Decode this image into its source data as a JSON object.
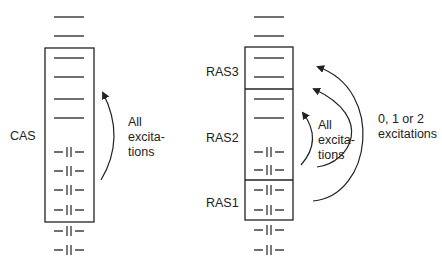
{
  "cas_panel": {
    "label": "CAS",
    "arrow_label": [
      "All",
      "excita-",
      "tions"
    ],
    "orbitals": [
      {
        "y": 17,
        "occupied": false
      },
      {
        "y": 36,
        "occupied": false
      },
      {
        "y": 58,
        "occupied": false
      },
      {
        "y": 77,
        "occupied": false
      },
      {
        "y": 99,
        "occupied": false
      },
      {
        "y": 118,
        "occupied": false
      },
      {
        "y": 152,
        "occupied": true
      },
      {
        "y": 171,
        "occupied": true
      },
      {
        "y": 190,
        "occupied": true
      },
      {
        "y": 210,
        "occupied": true
      },
      {
        "y": 231,
        "occupied": true
      },
      {
        "y": 250,
        "occupied": true
      }
    ]
  },
  "ras_panel": {
    "subspaces": [
      {
        "label": "RAS3"
      },
      {
        "label": "RAS2"
      },
      {
        "label": "RAS1"
      }
    ],
    "inner_arrow_label": [
      "All",
      "excita-",
      "tions"
    ],
    "outer_arrow_label": [
      "0, 1 or 2",
      "excitations"
    ],
    "orbitals": [
      {
        "y": 17,
        "occupied": false
      },
      {
        "y": 36,
        "occupied": false
      },
      {
        "y": 58,
        "occupied": false
      },
      {
        "y": 77,
        "occupied": false
      },
      {
        "y": 99,
        "occupied": false
      },
      {
        "y": 118,
        "occupied": false
      },
      {
        "y": 152,
        "occupied": true
      },
      {
        "y": 170,
        "occupied": true
      },
      {
        "y": 190,
        "occupied": true
      },
      {
        "y": 210,
        "occupied": true
      },
      {
        "y": 230,
        "occupied": true
      },
      {
        "y": 250,
        "occupied": true
      }
    ]
  }
}
